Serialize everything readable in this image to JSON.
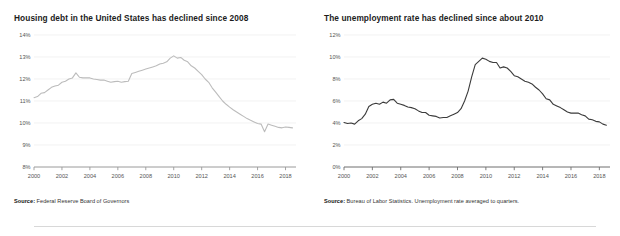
{
  "divider": {
    "name": "footer-divider"
  },
  "charts": [
    {
      "id": "housing-debt",
      "title": "Housing debt in the United States has declined since 2008",
      "source_label": "Source:",
      "source_text": " Federal Reserve Board of Governors",
      "line_color": "#bcbcbc",
      "axis_color": "#9a9a9a",
      "grid_color": "#ededed",
      "chart_data": {
        "type": "line",
        "title": "Housing debt in the United States has declined since 2008",
        "xlabel": "",
        "ylabel": "",
        "xlim": [
          2000,
          2018.75
        ],
        "ylim": [
          8,
          14
        ],
        "grid": true,
        "legend": "none",
        "ytick_labels": [
          "8%",
          "9%",
          "10%",
          "11%",
          "12%",
          "13%",
          "14%"
        ],
        "yticks": [
          8,
          9,
          10,
          11,
          12,
          13,
          14
        ],
        "xtick_labels": [
          "2000",
          "2002",
          "2004",
          "2006",
          "2008",
          "2010",
          "2012",
          "2014",
          "2016",
          "2018"
        ],
        "xticks": [
          2000,
          2002,
          2004,
          2006,
          2008,
          2010,
          2012,
          2014,
          2016,
          2018
        ],
        "series": [
          {
            "name": "Housing debt (% of disposable income)",
            "x": [
              2000.0,
              2000.25,
              2000.5,
              2000.75,
              2001.0,
              2001.25,
              2001.5,
              2001.75,
              2002.0,
              2002.25,
              2002.5,
              2002.75,
              2003.0,
              2003.25,
              2003.5,
              2003.75,
              2004.0,
              2004.25,
              2004.5,
              2004.75,
              2005.0,
              2005.25,
              2005.5,
              2005.75,
              2006.0,
              2006.25,
              2006.5,
              2006.75,
              2007.0,
              2007.25,
              2007.5,
              2007.75,
              2008.0,
              2008.25,
              2008.5,
              2008.75,
              2009.0,
              2009.25,
              2009.5,
              2009.75,
              2010.0,
              2010.25,
              2010.5,
              2010.75,
              2011.0,
              2011.25,
              2011.5,
              2011.75,
              2012.0,
              2012.25,
              2012.5,
              2012.75,
              2013.0,
              2013.25,
              2013.5,
              2013.75,
              2014.0,
              2014.25,
              2014.5,
              2014.75,
              2015.0,
              2015.25,
              2015.5,
              2015.75,
              2016.0,
              2016.25,
              2016.5,
              2016.75,
              2017.0,
              2017.25,
              2017.5,
              2017.75,
              2018.0,
              2018.25,
              2018.5
            ],
            "y": [
              11.15,
              11.2,
              11.35,
              11.38,
              11.5,
              11.62,
              11.68,
              11.72,
              11.85,
              11.9,
              12.0,
              12.05,
              12.28,
              12.08,
              12.05,
              12.05,
              12.05,
              12.0,
              11.98,
              11.95,
              11.95,
              11.9,
              11.85,
              11.88,
              11.9,
              11.85,
              11.88,
              11.9,
              12.25,
              12.3,
              12.35,
              12.4,
              12.45,
              12.5,
              12.55,
              12.6,
              12.68,
              12.72,
              12.78,
              12.95,
              13.05,
              12.95,
              12.98,
              12.85,
              12.78,
              12.6,
              12.5,
              12.35,
              12.2,
              12.0,
              11.85,
              11.6,
              11.4,
              11.2,
              11.0,
              10.85,
              10.72,
              10.6,
              10.5,
              10.4,
              10.3,
              10.2,
              10.12,
              10.05,
              9.98,
              9.95,
              9.6,
              9.95,
              9.9,
              9.85,
              9.8,
              9.78,
              9.82,
              9.8,
              9.78
            ]
          }
        ]
      }
    },
    {
      "id": "unemployment-rate",
      "title": "The unemployment rate has declined since about 2010",
      "source_label": "Source:",
      "source_text": " Bureau of Labor Statistics. Unemployment rate averaged to quarters.",
      "line_color": "#3b3b3b",
      "axis_color": "#6e6e6e",
      "grid_color": "#ededed",
      "chart_data": {
        "type": "line",
        "title": "The unemployment rate has declined since about 2010",
        "xlabel": "",
        "ylabel": "",
        "xlim": [
          2000,
          2018.75
        ],
        "ylim": [
          0,
          12
        ],
        "grid": true,
        "legend": "none",
        "ytick_labels": [
          "0%",
          "2%",
          "4%",
          "6%",
          "8%",
          "10%",
          "12%"
        ],
        "yticks": [
          0,
          2,
          4,
          6,
          8,
          10,
          12
        ],
        "xtick_labels": [
          "2000",
          "2002",
          "2004",
          "2006",
          "2008",
          "2010",
          "2012",
          "2014",
          "2016",
          "2018"
        ],
        "xticks": [
          2000,
          2002,
          2004,
          2006,
          2008,
          2010,
          2012,
          2014,
          2016,
          2018
        ],
        "series": [
          {
            "name": "Unemployment rate (quarterly average)",
            "x": [
              2000.0,
              2000.25,
              2000.5,
              2000.75,
              2001.0,
              2001.25,
              2001.5,
              2001.75,
              2002.0,
              2002.25,
              2002.5,
              2002.75,
              2003.0,
              2003.25,
              2003.5,
              2003.75,
              2004.0,
              2004.25,
              2004.5,
              2004.75,
              2005.0,
              2005.25,
              2005.5,
              2005.75,
              2006.0,
              2006.25,
              2006.5,
              2006.75,
              2007.0,
              2007.25,
              2007.5,
              2007.75,
              2008.0,
              2008.25,
              2008.5,
              2008.75,
              2009.0,
              2009.25,
              2009.5,
              2009.75,
              2010.0,
              2010.25,
              2010.5,
              2010.75,
              2011.0,
              2011.25,
              2011.5,
              2011.75,
              2012.0,
              2012.25,
              2012.5,
              2012.75,
              2013.0,
              2013.25,
              2013.5,
              2013.75,
              2014.0,
              2014.25,
              2014.5,
              2014.75,
              2015.0,
              2015.25,
              2015.5,
              2015.75,
              2016.0,
              2016.25,
              2016.5,
              2016.75,
              2017.0,
              2017.25,
              2017.5,
              2017.75,
              2018.0,
              2018.25,
              2018.5
            ],
            "y": [
              4.05,
              3.95,
              4.0,
              3.9,
              4.2,
              4.4,
              4.8,
              5.5,
              5.7,
              5.8,
              5.7,
              5.9,
              5.8,
              6.1,
              6.15,
              5.8,
              5.7,
              5.6,
              5.45,
              5.4,
              5.3,
              5.1,
              4.95,
              4.95,
              4.7,
              4.65,
              4.6,
              4.45,
              4.5,
              4.5,
              4.65,
              4.8,
              4.95,
              5.3,
              6.0,
              6.9,
              8.2,
              9.3,
              9.6,
              9.9,
              9.8,
              9.6,
              9.5,
              9.5,
              9.0,
              9.1,
              9.0,
              8.7,
              8.3,
              8.2,
              8.0,
              7.8,
              7.7,
              7.55,
              7.25,
              7.0,
              6.65,
              6.2,
              6.1,
              5.7,
              5.55,
              5.4,
              5.2,
              5.0,
              4.9,
              4.9,
              4.9,
              4.75,
              4.65,
              4.35,
              4.3,
              4.15,
              4.1,
              3.9,
              3.8
            ]
          }
        ]
      }
    }
  ]
}
